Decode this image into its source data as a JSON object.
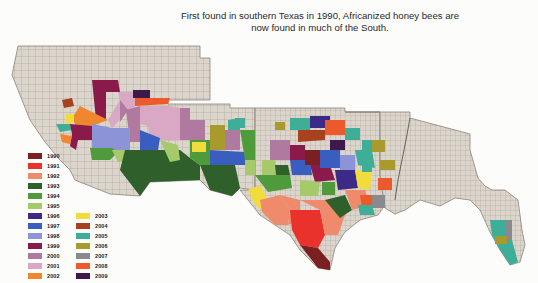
{
  "title": {
    "line1": "First found in southern Texas in 1990, Africanized honey bees are",
    "line2": "now found in much of the South."
  },
  "map": {
    "subject": "Spread of Africanized honey bees by county, 1990-2009",
    "base_color": "#dcd5cc",
    "border_color": "#8c8378",
    "regions_shown": [
      "California",
      "Nevada",
      "Utah",
      "Arizona",
      "New Mexico",
      "Texas",
      "Oklahoma",
      "Arkansas",
      "Louisiana",
      "Mississippi",
      "Alabama",
      "Georgia",
      "Florida"
    ]
  },
  "legend": {
    "column1": [
      {
        "year": "1990",
        "color": "#7a1f22"
      },
      {
        "year": "1991",
        "color": "#e8322b"
      },
      {
        "year": "1992",
        "color": "#ef8a6c"
      },
      {
        "year": "1993",
        "color": "#2f5f2a"
      },
      {
        "year": "1994",
        "color": "#4f9a3a"
      },
      {
        "year": "1995",
        "color": "#a6c96a"
      },
      {
        "year": "1996",
        "color": "#3d2a86"
      },
      {
        "year": "1997",
        "color": "#3a5ec0"
      },
      {
        "year": "1998",
        "color": "#8c93d6"
      },
      {
        "year": "1999",
        "color": "#8a1a4a"
      },
      {
        "year": "2000",
        "color": "#b07aa0"
      },
      {
        "year": "2001",
        "color": "#d8a8c4"
      },
      {
        "year": "2002",
        "color": "#f0862e"
      }
    ],
    "column2": [
      {
        "year": "2003",
        "color": "#f0dc3a"
      },
      {
        "year": "2004",
        "color": "#a8421e"
      },
      {
        "year": "2005",
        "color": "#3fae98"
      },
      {
        "year": "2006",
        "color": "#a89a2c"
      },
      {
        "year": "2007",
        "color": "#8a8a8e"
      },
      {
        "year": "2008",
        "color": "#ec5a2c"
      },
      {
        "year": "2009",
        "color": "#3e1a4c"
      }
    ]
  }
}
